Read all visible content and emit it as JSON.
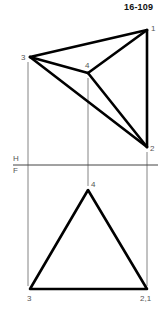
{
  "figure": {
    "title": "16-109",
    "colors": {
      "line": "#000000",
      "projection": "#666666",
      "label": "#555555"
    },
    "reference_line": {
      "upper_label": "H",
      "lower_label": "F"
    },
    "top_view": {
      "points": [
        {
          "id": "1",
          "label": "1",
          "x": 147,
          "y": 30
        },
        {
          "id": "2",
          "label": "2",
          "x": 147,
          "y": 147
        },
        {
          "id": "3",
          "label": "3",
          "x": 30,
          "y": 57
        },
        {
          "id": "4",
          "label": "4",
          "x": 88,
          "y": 73
        }
      ],
      "edges": [
        [
          "1",
          "3"
        ],
        [
          "1",
          "2"
        ],
        [
          "3",
          "2"
        ],
        [
          "3",
          "4"
        ],
        [
          "4",
          "1"
        ],
        [
          "4",
          "2"
        ]
      ]
    },
    "front_view": {
      "points": [
        {
          "id": "4",
          "label": "4",
          "x": 88,
          "y": 190
        },
        {
          "id": "3",
          "label": "3",
          "x": 30,
          "y": 289
        },
        {
          "id": "21",
          "label": "2,1",
          "x": 147,
          "y": 289
        }
      ],
      "edges": [
        [
          "4",
          "3"
        ],
        [
          "4",
          "21"
        ],
        [
          "3",
          "21"
        ]
      ]
    }
  }
}
